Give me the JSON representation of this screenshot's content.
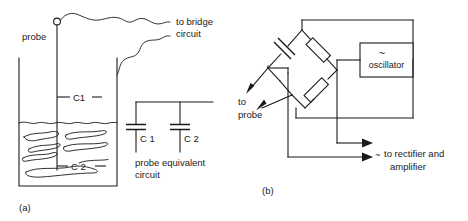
{
  "figure": {
    "panels": [
      {
        "id": "a",
        "caption": "(a)",
        "title": "capacitive level probe in tank",
        "labels": {
          "probe": "probe",
          "c1_gap": "C1",
          "c2_gap": "C 2",
          "to_bridge_line1": "to bridge",
          "to_bridge_line2": "circuit"
        },
        "equivalent_circuit": {
          "cap1": "C 1",
          "cap2": "C 2",
          "caption_line1": "probe  equivalent",
          "caption_line2": "circuit"
        }
      },
      {
        "id": "b",
        "caption": "(b)",
        "title": "bridge circuit with oscillator",
        "labels": {
          "oscillator": "oscillator",
          "oscillator_symbol": "~",
          "to_line1": "to",
          "to_line2": "probe",
          "output_symbol": "~",
          "output_line1": "to rectifier and",
          "output_line2": "amplifier"
        }
      }
    ],
    "icons": {
      "terminal": "circle-terminal-icon",
      "capacitor": "capacitor-icon",
      "resistor": "resistor-icon",
      "arrow": "arrow-icon",
      "wavy_wire": "wavy-wire-icon",
      "liquid": "liquid-squiggle-icon",
      "ac_source": "ac-tilde-icon"
    },
    "colors": {
      "ink": "#1a1a1a",
      "paper": "#ffffff"
    }
  }
}
